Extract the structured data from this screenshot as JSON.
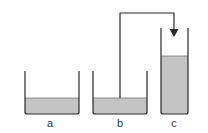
{
  "diagram": {
    "type": "siphon-containers",
    "colors": {
      "stroke": "#2a2a2a",
      "liquid": "#c4c4c4",
      "background": "#ffffff"
    },
    "containers": [
      {
        "id": "a",
        "label": "a"
      },
      {
        "id": "b",
        "label": "b"
      },
      {
        "id": "c",
        "label": "c"
      }
    ],
    "connection": {
      "from": "b",
      "to": "c",
      "arrow": "down-into-c"
    }
  }
}
